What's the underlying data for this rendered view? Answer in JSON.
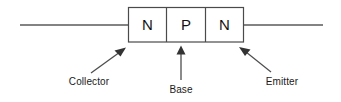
{
  "diagram": {
    "type": "semiconductor-cross-section",
    "colors": {
      "background": "#ffffff",
      "box_stroke": "#4a4a4a",
      "lead_stroke": "#5a5a5a",
      "arrow": "#333333",
      "text": "#111111"
    },
    "regions": [
      {
        "letter": "N",
        "name": "collector-region"
      },
      {
        "letter": "P",
        "name": "base-region"
      },
      {
        "letter": "N",
        "name": "emitter-region"
      }
    ],
    "callouts": [
      {
        "label": "Collector",
        "target_region": "collector-region"
      },
      {
        "label": "Base",
        "target_region": "base-region"
      },
      {
        "label": "Emitter",
        "target_region": "emitter-region"
      }
    ],
    "leads": [
      {
        "name": "collector-lead",
        "side": "left"
      },
      {
        "name": "emitter-lead",
        "side": "right"
      }
    ]
  }
}
